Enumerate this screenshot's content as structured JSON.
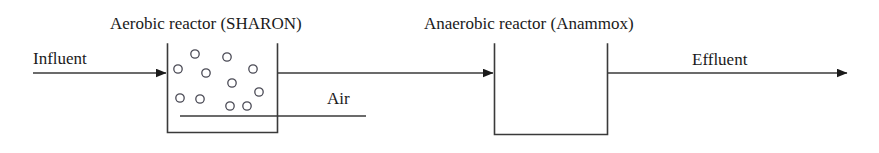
{
  "diagram": {
    "kind": "process-flow-diagram",
    "stroke_color": "#3a3a3a",
    "text_color": "#1a1a1a",
    "background_color": "#ffffff",
    "canvas": {
      "width": 879,
      "height": 153
    }
  },
  "titles": {
    "aerobic": "Aerobic reactor (SHARON)",
    "anaerobic": "Anaerobic reactor (Anammox)"
  },
  "streams": {
    "influent": "Influent",
    "effluent": "Effluent",
    "air": "Air"
  },
  "units": {
    "aerobic_reactor": {
      "name": "Aerobic reactor (SHARON)",
      "x": 167,
      "y": 44,
      "width": 111,
      "height": 89,
      "open_top": true,
      "bubble_count": 12,
      "bubble_radius": 4.2,
      "bubbles": [
        {
          "cx": 195,
          "cy": 54
        },
        {
          "cx": 227,
          "cy": 57
        },
        {
          "cx": 178,
          "cy": 69
        },
        {
          "cx": 206,
          "cy": 73
        },
        {
          "cx": 253,
          "cy": 69
        },
        {
          "cx": 232,
          "cy": 83
        },
        {
          "cx": 259,
          "cy": 92
        },
        {
          "cx": 180,
          "cy": 98
        },
        {
          "cx": 200,
          "cy": 99
        },
        {
          "cx": 230,
          "cy": 106
        },
        {
          "cx": 247,
          "cy": 106
        },
        {
          "cx": 214,
          "cy": 89
        }
      ]
    },
    "anaerobic_reactor": {
      "name": "Anaerobic reactor (Anammox)",
      "x": 494,
      "y": 44,
      "width": 114,
      "height": 91,
      "open_top": true
    }
  },
  "connections": {
    "influent_line": {
      "x1": 33,
      "y1": 73,
      "x2": 167,
      "y2": 73,
      "arrowhead": "right"
    },
    "interstage_line": {
      "x1": 278,
      "y1": 73,
      "x2": 494,
      "y2": 73,
      "arrowhead": "right"
    },
    "effluent_line": {
      "x1": 608,
      "y1": 73,
      "x2": 848,
      "y2": 73,
      "arrowhead": "right"
    },
    "air_line": {
      "x1": 180,
      "y1": 116,
      "x2": 366,
      "y2": 116,
      "arrowhead": "none"
    }
  }
}
